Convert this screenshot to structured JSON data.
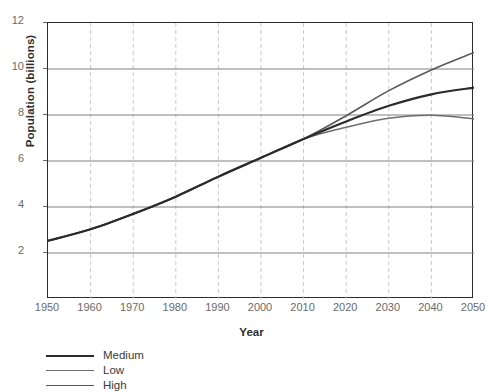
{
  "chart_data": {
    "type": "line",
    "title": "",
    "xlabel": "Year",
    "ylabel": "Population (billions)",
    "xlim": [
      1950,
      2050
    ],
    "ylim": [
      0,
      12
    ],
    "xticks": [
      1950,
      1960,
      1970,
      1980,
      1990,
      2000,
      2010,
      2020,
      2030,
      2040,
      2050
    ],
    "yticks": [
      2,
      4,
      6,
      8,
      10,
      12
    ],
    "grid": {
      "horizontal": "solid",
      "vertical": "dashed"
    },
    "legend_position": "below-left",
    "x": [
      1950,
      1960,
      1970,
      1980,
      1990,
      2000,
      2010,
      2020,
      2030,
      2040,
      2050
    ],
    "series": [
      {
        "name": "Medium",
        "color": "#2b2b2b",
        "width": 2.2,
        "values": [
          2.53,
          3.03,
          3.7,
          4.45,
          5.32,
          6.14,
          6.96,
          7.72,
          8.4,
          8.9,
          9.19
        ]
      },
      {
        "name": "Low",
        "color": "#6e6e6e",
        "width": 1.6,
        "values": [
          2.53,
          3.03,
          3.7,
          4.45,
          5.32,
          6.14,
          6.96,
          7.47,
          7.86,
          7.99,
          7.83
        ]
      },
      {
        "name": "High",
        "color": "#595959",
        "width": 1.6,
        "values": [
          2.53,
          3.03,
          3.7,
          4.45,
          5.32,
          6.14,
          6.96,
          7.97,
          9.06,
          9.96,
          10.72
        ]
      }
    ]
  },
  "legend": {
    "items": [
      {
        "label": "Medium",
        "color": "#2b2b2b",
        "width": 2.2
      },
      {
        "label": "Low",
        "color": "#6e6e6e",
        "width": 1.6
      },
      {
        "label": "High",
        "color": "#595959",
        "width": 1.6
      }
    ]
  },
  "colors": {
    "frame": "#2b2b2b",
    "hgrid": "#808080",
    "vgrid": "#c9c9c9",
    "tick_text": "#6a6a6a",
    "axis_title": "#2e2e2e",
    "background": "#ffffff"
  }
}
